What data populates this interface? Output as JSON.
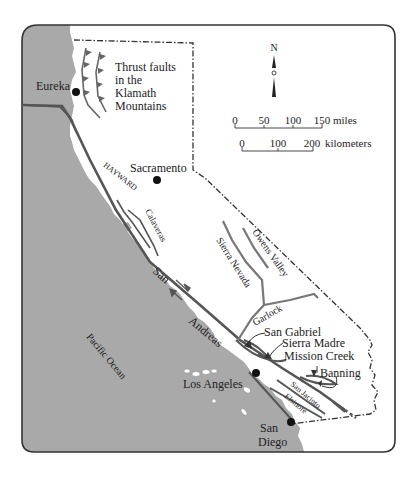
{
  "map": {
    "title_note": "Thrust faults in the Klamath Mountains",
    "thrust_label_lines": [
      "Thrust faults",
      "in the",
      "Klamath",
      "Mountains"
    ],
    "ocean_label": "Pacific Ocean",
    "colors": {
      "ocean": "#a9a9a9",
      "land": "#ffffff",
      "fault": "#555555",
      "frame": "#333333",
      "text": "#222222"
    },
    "cities": [
      {
        "name": "Eureka"
      },
      {
        "name": "Sacramento"
      },
      {
        "name": "Los Angeles"
      },
      {
        "name": "San Diego",
        "lines": [
          "San",
          "Diego"
        ]
      }
    ],
    "faults": {
      "hayward": "HAYWARD",
      "calaveras": "Calaveras",
      "san_andreas": [
        "San",
        "Andreas"
      ],
      "sierra_nevada": "Sierra Nevada",
      "owens_valley": "Owens Valley",
      "garlock": "Garlock",
      "san_gabriel": "San Gabriel",
      "sierra_madre": "Sierra Madre",
      "mission_creek": "Mission Creek",
      "banning": "Banning",
      "san_jacinto": "San Jacinto",
      "elsinore": "Elsinore"
    },
    "compass": {
      "label": "N"
    },
    "scale_miles": {
      "ticks": [
        "0",
        "50",
        "100",
        "150"
      ],
      "unit": "miles"
    },
    "scale_km": {
      "ticks": [
        "0",
        "100",
        "200"
      ],
      "unit": "kilometers"
    }
  }
}
